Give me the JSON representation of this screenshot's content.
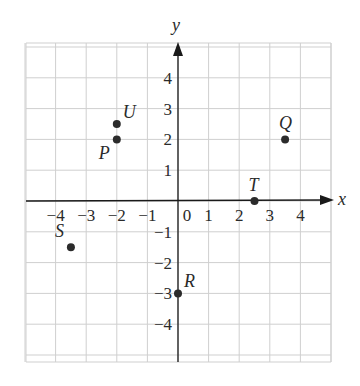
{
  "figure": {
    "type": "coordinate-plane",
    "x_axis_label": "x",
    "y_axis_label": "y",
    "x_ticks": [
      "-4",
      "-3",
      "-2",
      "-1",
      "0",
      "1",
      "2",
      "3",
      "4"
    ],
    "y_ticks": [
      "4",
      "3",
      "2",
      "1",
      "-1",
      "-2",
      "-3",
      "-4"
    ],
    "x_range": [
      -5,
      5
    ],
    "y_range": [
      -5.3,
      5
    ],
    "grid": true,
    "points": [
      {
        "label": "P",
        "x": -2,
        "y": 2,
        "label_pos": "lower-left"
      },
      {
        "label": "U",
        "x": -2,
        "y": 2.5,
        "label_pos": "upper-right"
      },
      {
        "label": "Q",
        "x": 3.5,
        "y": 2,
        "label_pos": "above"
      },
      {
        "label": "T",
        "x": 2.5,
        "y": 0,
        "label_pos": "above"
      },
      {
        "label": "S",
        "x": -3.5,
        "y": -1.5,
        "label_pos": "upper-left"
      },
      {
        "label": "R",
        "x": 0,
        "y": -3,
        "label_pos": "upper-right"
      }
    ]
  },
  "colors": {
    "grid": "#cfcfcf",
    "axis": "#1a1a1a",
    "point": "#2b2b2b",
    "text": "#2a2a2a"
  }
}
